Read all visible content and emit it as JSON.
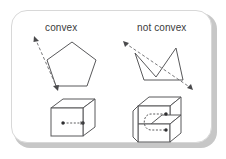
{
  "figure": {
    "card": {
      "background_color": "#ffffff",
      "border_color": "#d8d8d8",
      "shadow_color": "#9a9a9a"
    },
    "columns": [
      {
        "id": "convex",
        "heading": "convex"
      },
      {
        "id": "not-convex",
        "heading": "not convex"
      }
    ],
    "stroke_color": "#58585a",
    "dash_color": "#6a6a6c",
    "dot_color": "#2e2e30",
    "rows": [
      {
        "id": "polygon-row",
        "left": {
          "shape_name": "pentagon",
          "description": "convex pentagon with a dashed arrow line passing through it",
          "is_convex": true,
          "vertex_count": 5
        },
        "right": {
          "shape_name": "non-convex-polygon",
          "description": "non convex polygon with a reflex vertex and a dashed arrow line leaving the interior",
          "is_convex": false,
          "vertex_count": 5
        }
      },
      {
        "id": "solid-row",
        "left": {
          "shape_name": "cube",
          "description": "convex cube with two dots joined by a dashed segment inside",
          "is_convex": true,
          "dot_count": 2,
          "connector": "straight dashed segment"
        },
        "right": {
          "shape_name": "notched-cube",
          "description": "non convex notched solid with two dots joined by a curved dashed path around the notch",
          "is_convex": false,
          "dot_count": 2,
          "connector": "curved dashed path"
        }
      }
    ]
  }
}
